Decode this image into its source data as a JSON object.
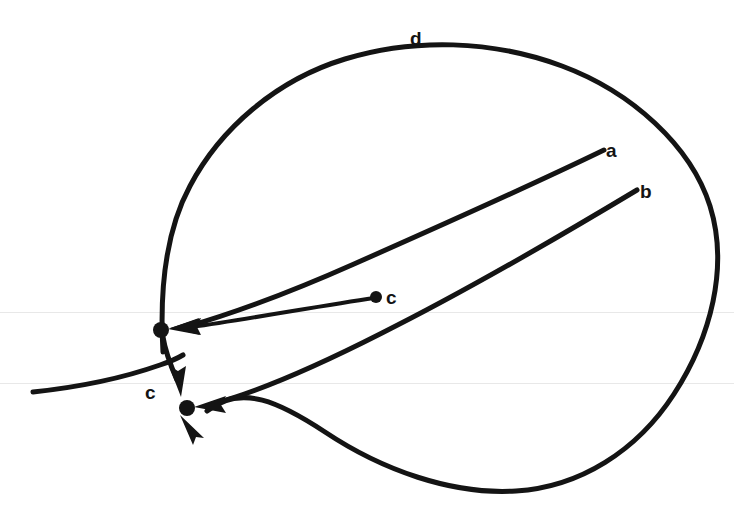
{
  "figure": {
    "kind": "directed-curve-diagram",
    "background_color": "#ffffff",
    "ink_color": "#141414",
    "width": 734,
    "height": 509,
    "labels": [
      {
        "id": "label-a",
        "text": "a",
        "x": 606,
        "y": 141
      },
      {
        "id": "label-b",
        "text": "b",
        "x": 640,
        "y": 182
      },
      {
        "id": "label-c-interior",
        "text": "c",
        "x": 386,
        "y": 288
      },
      {
        "id": "label-c-crossing",
        "text": "c",
        "x": 145,
        "y": 383
      },
      {
        "id": "label-d",
        "text": "d",
        "x": 410,
        "y": 29
      }
    ],
    "nodes": [
      {
        "id": "node-upper",
        "x": 161,
        "y": 330,
        "r": 8
      },
      {
        "id": "node-lower",
        "x": 187,
        "y": 408,
        "r": 8
      },
      {
        "id": "node-interior-c",
        "x": 376,
        "y": 297,
        "r": 6
      }
    ],
    "curves": [
      {
        "id": "curve-d-ellipse",
        "label": "d",
        "stroke_width": 5,
        "description": "large tilted closed oval passing through both marked points"
      },
      {
        "id": "curve-a",
        "label": "a",
        "stroke_width": 5,
        "description": "arc from upper right interior sweeping left into the upper node"
      },
      {
        "id": "curve-b",
        "label": "b",
        "stroke_width": 5,
        "description": "arc from right interior sweeping left into the lower node"
      },
      {
        "id": "curve-c-arrow",
        "label": "c",
        "stroke_width": 4,
        "description": "short straight arrow from the interior c dot to the upper node"
      },
      {
        "id": "curve-c-transversal",
        "label": "c",
        "stroke_width": 5,
        "description": "curve entering from the left edge, crossing, then turning down into the lower node"
      }
    ],
    "arrowheads": [
      {
        "id": "arrowhead-a",
        "target": "node-upper",
        "direction": "left"
      },
      {
        "id": "arrowhead-b",
        "target": "node-lower",
        "direction": "left"
      },
      {
        "id": "arrowhead-c-arrow",
        "target": "node-upper",
        "direction": "left"
      },
      {
        "id": "arrowhead-c-transversal",
        "target": "node-lower",
        "direction": "down"
      },
      {
        "id": "arrowhead-d",
        "target": "node-lower",
        "direction": "up-left"
      }
    ]
  }
}
